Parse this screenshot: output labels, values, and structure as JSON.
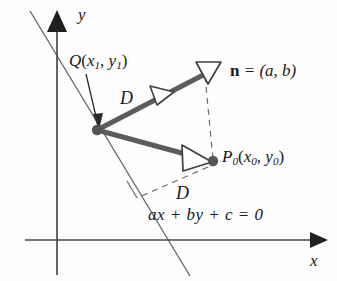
{
  "figure": {
    "type": "geometry-diagram",
    "background_color": "#fdfdfd"
  },
  "colors": {
    "axis": "#4a4a4a",
    "line": "#6b6b6b",
    "vector": "#5c5c5c",
    "dashed": "#707070",
    "text": "#1a1a1a",
    "point_fill": "#555555",
    "arrow_open_fill": "#ffffff"
  },
  "axes": {
    "x_label": "x",
    "y_label": "y",
    "origin": {
      "x": 57,
      "y": 240
    },
    "x_axis": {
      "x1": 25,
      "y1": 240,
      "x2": 322,
      "y2": 240,
      "arrow": "right-filled"
    },
    "y_axis": {
      "x1": 57,
      "y1": 275,
      "x2": 57,
      "y2": 14,
      "arrow": "up-filled"
    }
  },
  "points": {
    "q": {
      "label_main": "Q",
      "label_args": "(x1, y1)",
      "sub1": "1",
      "sub2": "1",
      "x": 97,
      "y": 130
    },
    "p0": {
      "label_main": "P",
      "sub0": "0",
      "label_args": "(x0, y0)",
      "x": 212,
      "y": 162
    }
  },
  "vectors": {
    "normal": {
      "label_name": "n",
      "label_eq": " = (a, b)",
      "full_label": "n = (a, b)",
      "from": {
        "x": 97,
        "y": 130
      },
      "to": {
        "x": 211,
        "y": 71
      },
      "arrow_style": "open-triangle",
      "mid_arrow": true
    },
    "to_p0": {
      "from": {
        "x": 97,
        "y": 130
      },
      "to": {
        "x": 210,
        "y": 161
      },
      "arrow_style": "open-triangle"
    }
  },
  "distances": {
    "upper": "D",
    "lower": "D"
  },
  "line": {
    "equation": "ax + by + c = 0",
    "from": {
      "x": 30,
      "y": 11
    },
    "to": {
      "x": 190,
      "y": 276
    }
  },
  "dashed_segments": [
    {
      "name": "vector-tip-to-p0",
      "x1": 206,
      "y1": 77,
      "x2": 213,
      "y2": 160
    },
    {
      "name": "p0-to-line-foot",
      "x1": 209,
      "y1": 166,
      "x2": 137,
      "y2": 197
    },
    {
      "name": "line-foot-tick",
      "x1": 137,
      "y1": 197,
      "x2": 128,
      "y2": 182
    }
  ]
}
